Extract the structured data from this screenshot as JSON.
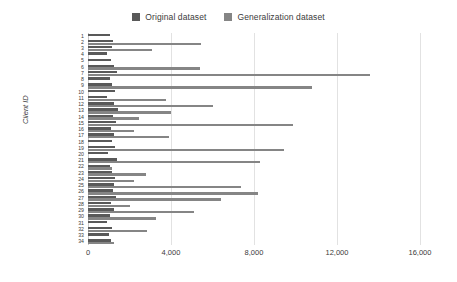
{
  "chart_data": {
    "type": "bar",
    "orientation": "horizontal",
    "title": "",
    "xlabel": "",
    "ylabel": "Client ID",
    "xlim": [
      0,
      16000
    ],
    "xticks": [
      0,
      4000,
      8000,
      12000,
      16000
    ],
    "xtick_labels": [
      "0",
      "4,000",
      "8,000",
      "12,000",
      "16,000"
    ],
    "grid": true,
    "legend_position": "top-center",
    "categories": [
      "1",
      "2",
      "3",
      "4",
      "5",
      "6",
      "7",
      "8",
      "9",
      "10",
      "11",
      "12",
      "13",
      "14",
      "15",
      "16",
      "17",
      "18",
      "19",
      "20",
      "21",
      "22",
      "23",
      "24",
      "25",
      "26",
      "27",
      "28",
      "29",
      "30",
      "31",
      "32",
      "33",
      "34"
    ],
    "series": [
      {
        "name": "Original dataset",
        "color": "#595959",
        "values": [
          1050,
          1200,
          1150,
          900,
          1100,
          1250,
          1400,
          1050,
          1150,
          1300,
          900,
          1250,
          1450,
          1200,
          1350,
          1100,
          1250,
          1150,
          1300,
          950,
          1400,
          1050,
          1150,
          1300,
          1250,
          1200,
          1350,
          1100,
          1250,
          1050,
          900,
          1150,
          1000,
          1100
        ]
      },
      {
        "name": "Generalization dataset",
        "color": "#858585",
        "values": [
          0,
          5450,
          3100,
          0,
          0,
          5400,
          13600,
          0,
          10800,
          0,
          3750,
          6000,
          4000,
          2450,
          9900,
          2200,
          3900,
          0,
          9450,
          0,
          8300,
          1150,
          2800,
          2200,
          7350,
          8200,
          6400,
          2000,
          5100,
          3300,
          0,
          2850,
          0,
          1250
        ]
      }
    ]
  },
  "legend": {
    "items": [
      {
        "label": "Original dataset",
        "color": "#595959"
      },
      {
        "label": "Generalization dataset",
        "color": "#858585"
      }
    ]
  }
}
